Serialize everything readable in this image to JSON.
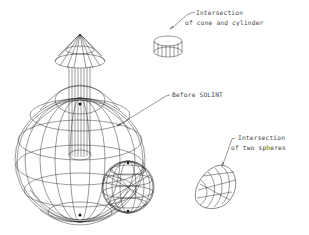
{
  "diagram": {
    "type": "cad-wireframe-illustration",
    "labels": {
      "cone_cylinder": {
        "line1": "Intersection",
        "line2": "of cone and cylinder"
      },
      "before": {
        "text": "Before SOLINT"
      },
      "two_spheres": {
        "line1": "Intersection",
        "line2": "of two spheres"
      }
    },
    "objects": [
      {
        "name": "cone",
        "description": "cone on top of cylinder"
      },
      {
        "name": "cylinder",
        "description": "vertical cylinder passing through large sphere"
      },
      {
        "name": "large-sphere",
        "description": "large wireframe sphere"
      },
      {
        "name": "small-sphere",
        "description": "small wireframe sphere overlapping large sphere"
      },
      {
        "name": "cone-cylinder-intersection",
        "description": "short cylinder ring result"
      },
      {
        "name": "sphere-intersection",
        "description": "lens-shaped result of two spheres"
      }
    ],
    "colors": {
      "background": "#ffffff",
      "lines": "#222222"
    }
  }
}
